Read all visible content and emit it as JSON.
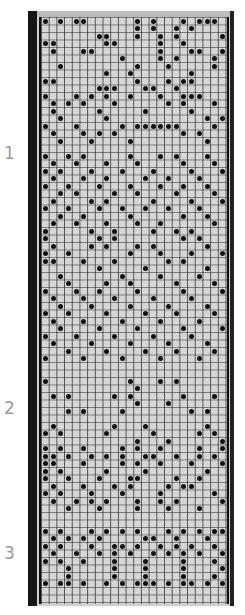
{
  "section_labels": [
    {
      "text": "1",
      "top": 143
    },
    {
      "text": "2",
      "top": 398
    },
    {
      "text": "3",
      "top": 543
    }
  ],
  "card": {
    "columns": 24,
    "rows": 78,
    "cell_w": 7.7,
    "cell_h": 7.5,
    "colors": {
      "background": "#d6d6d6",
      "band": "#161616",
      "hole": "#111111"
    }
  },
  "holes": [
    [
      1,
      1
    ],
    [
      3,
      1
    ],
    [
      5,
      1
    ],
    [
      6,
      1
    ],
    [
      13,
      1
    ],
    [
      15,
      1
    ],
    [
      19,
      1
    ],
    [
      21,
      1
    ],
    [
      22,
      1
    ],
    [
      23,
      1
    ],
    [
      13,
      2
    ],
    [
      15,
      2
    ],
    [
      18,
      2
    ],
    [
      20,
      2
    ],
    [
      8,
      3
    ],
    [
      9,
      3
    ],
    [
      13,
      3
    ],
    [
      16,
      3
    ],
    [
      18,
      3
    ],
    [
      24,
      3
    ],
    [
      1,
      4
    ],
    [
      2,
      4
    ],
    [
      9,
      4
    ],
    [
      10,
      4
    ],
    [
      16,
      4
    ],
    [
      19,
      4
    ],
    [
      2,
      5
    ],
    [
      6,
      5
    ],
    [
      7,
      5
    ],
    [
      16,
      5
    ],
    [
      20,
      5
    ],
    [
      21,
      5
    ],
    [
      24,
      5
    ],
    [
      11,
      6
    ],
    [
      16,
      6
    ],
    [
      18,
      6
    ],
    [
      23,
      6
    ],
    [
      3,
      7
    ],
    [
      13,
      7
    ],
    [
      17,
      7
    ],
    [
      23,
      7
    ],
    [
      9,
      8
    ],
    [
      12,
      8
    ],
    [
      20,
      8
    ],
    [
      1,
      9
    ],
    [
      2,
      9
    ],
    [
      13,
      9
    ],
    [
      17,
      9
    ],
    [
      19,
      9
    ],
    [
      20,
      9
    ],
    [
      8,
      10
    ],
    [
      9,
      10
    ],
    [
      10,
      10
    ],
    [
      14,
      10
    ],
    [
      15,
      10
    ],
    [
      18,
      10
    ],
    [
      1,
      11
    ],
    [
      5,
      11
    ],
    [
      7,
      11
    ],
    [
      9,
      11
    ],
    [
      12,
      11
    ],
    [
      16,
      11
    ],
    [
      19,
      11
    ],
    [
      20,
      11
    ],
    [
      21,
      11
    ],
    [
      2,
      12
    ],
    [
      4,
      12
    ],
    [
      6,
      12
    ],
    [
      10,
      12
    ],
    [
      17,
      12
    ],
    [
      19,
      12
    ],
    [
      23,
      12
    ],
    [
      2,
      13
    ],
    [
      8,
      13
    ],
    [
      14,
      13
    ],
    [
      20,
      13
    ],
    [
      3,
      14
    ],
    [
      9,
      14
    ],
    [
      22,
      14
    ],
    [
      24,
      14
    ],
    [
      1,
      15
    ],
    [
      5,
      15
    ],
    [
      11,
      15
    ],
    [
      13,
      15
    ],
    [
      14,
      15
    ],
    [
      15,
      15
    ],
    [
      16,
      15
    ],
    [
      17,
      15
    ],
    [
      18,
      15
    ],
    [
      23,
      15
    ],
    [
      2,
      16
    ],
    [
      6,
      16
    ],
    [
      8,
      16
    ],
    [
      10,
      16
    ],
    [
      19,
      16
    ],
    [
      21,
      16
    ],
    [
      3,
      17
    ],
    [
      7,
      17
    ],
    [
      12,
      17
    ],
    [
      22,
      17
    ],
    [
      1,
      19
    ],
    [
      4,
      19
    ],
    [
      6,
      19
    ],
    [
      12,
      19
    ],
    [
      16,
      19
    ],
    [
      18,
      19
    ],
    [
      22,
      19
    ],
    [
      2,
      20
    ],
    [
      5,
      20
    ],
    [
      9,
      20
    ],
    [
      13,
      20
    ],
    [
      19,
      20
    ],
    [
      23,
      20
    ],
    [
      1,
      21
    ],
    [
      3,
      21
    ],
    [
      7,
      21
    ],
    [
      11,
      21
    ],
    [
      15,
      21
    ],
    [
      20,
      21
    ],
    [
      24,
      21
    ],
    [
      2,
      22
    ],
    [
      6,
      22
    ],
    [
      9,
      22
    ],
    [
      14,
      22
    ],
    [
      17,
      22
    ],
    [
      21,
      22
    ],
    [
      1,
      23
    ],
    [
      4,
      23
    ],
    [
      8,
      23
    ],
    [
      12,
      23
    ],
    [
      16,
      23
    ],
    [
      19,
      23
    ],
    [
      22,
      23
    ],
    [
      3,
      24
    ],
    [
      5,
      24
    ],
    [
      10,
      24
    ],
    [
      13,
      24
    ],
    [
      18,
      24
    ],
    [
      23,
      24
    ],
    [
      2,
      25
    ],
    [
      7,
      25
    ],
    [
      9,
      25
    ],
    [
      15,
      25
    ],
    [
      20,
      25
    ],
    [
      24,
      25
    ],
    [
      1,
      26
    ],
    [
      4,
      26
    ],
    [
      8,
      26
    ],
    [
      11,
      26
    ],
    [
      14,
      26
    ],
    [
      17,
      26
    ],
    [
      21,
      26
    ],
    [
      3,
      27
    ],
    [
      6,
      27
    ],
    [
      12,
      27
    ],
    [
      19,
      27
    ],
    [
      22,
      27
    ],
    [
      2,
      28
    ],
    [
      5,
      28
    ],
    [
      9,
      28
    ],
    [
      13,
      28
    ],
    [
      16,
      28
    ],
    [
      23,
      28
    ],
    [
      1,
      29
    ],
    [
      7,
      29
    ],
    [
      10,
      29
    ],
    [
      15,
      29
    ],
    [
      18,
      29
    ],
    [
      20,
      29
    ],
    [
      1,
      30
    ],
    [
      8,
      30
    ],
    [
      10,
      30
    ],
    [
      19,
      30
    ],
    [
      21,
      30
    ],
    [
      2,
      31
    ],
    [
      7,
      31
    ],
    [
      9,
      31
    ],
    [
      13,
      31
    ],
    [
      15,
      31
    ],
    [
      22,
      31
    ],
    [
      1,
      32
    ],
    [
      4,
      32
    ],
    [
      12,
      32
    ],
    [
      16,
      32
    ],
    [
      20,
      32
    ],
    [
      24,
      32
    ],
    [
      1,
      33
    ],
    [
      2,
      33
    ],
    [
      6,
      33
    ],
    [
      10,
      33
    ],
    [
      17,
      33
    ],
    [
      19,
      33
    ],
    [
      8,
      34
    ],
    [
      14,
      34
    ],
    [
      22,
      34
    ],
    [
      3,
      35
    ],
    [
      11,
      35
    ],
    [
      16,
      35
    ],
    [
      21,
      35
    ],
    [
      4,
      36
    ],
    [
      9,
      36
    ],
    [
      12,
      36
    ],
    [
      18,
      36
    ],
    [
      23,
      36
    ],
    [
      1,
      37
    ],
    [
      5,
      37
    ],
    [
      8,
      37
    ],
    [
      13,
      37
    ],
    [
      19,
      37
    ],
    [
      24,
      37
    ],
    [
      2,
      38
    ],
    [
      6,
      38
    ],
    [
      10,
      38
    ],
    [
      15,
      38
    ],
    [
      20,
      38
    ],
    [
      3,
      39
    ],
    [
      7,
      39
    ],
    [
      12,
      39
    ],
    [
      17,
      39
    ],
    [
      22,
      39
    ],
    [
      1,
      40
    ],
    [
      4,
      40
    ],
    [
      9,
      40
    ],
    [
      14,
      40
    ],
    [
      18,
      40
    ],
    [
      23,
      40
    ],
    [
      2,
      41
    ],
    [
      6,
      41
    ],
    [
      11,
      41
    ],
    [
      16,
      41
    ],
    [
      21,
      41
    ],
    [
      3,
      42
    ],
    [
      8,
      42
    ],
    [
      13,
      42
    ],
    [
      19,
      42
    ],
    [
      24,
      42
    ],
    [
      1,
      43
    ],
    [
      5,
      43
    ],
    [
      10,
      43
    ],
    [
      15,
      43
    ],
    [
      20,
      43
    ],
    [
      2,
      44
    ],
    [
      7,
      44
    ],
    [
      12,
      44
    ],
    [
      17,
      44
    ],
    [
      22,
      44
    ],
    [
      4,
      45
    ],
    [
      9,
      45
    ],
    [
      14,
      45
    ],
    [
      18,
      45
    ],
    [
      23,
      45
    ],
    [
      1,
      46
    ],
    [
      6,
      46
    ],
    [
      11,
      46
    ],
    [
      16,
      46
    ],
    [
      21,
      46
    ],
    [
      1,
      49
    ],
    [
      12,
      49
    ],
    [
      16,
      49
    ],
    [
      18,
      49
    ],
    [
      13,
      50
    ],
    [
      2,
      51
    ],
    [
      4,
      51
    ],
    [
      10,
      51
    ],
    [
      12,
      51
    ],
    [
      19,
      51
    ],
    [
      23,
      51
    ],
    [
      13,
      52
    ],
    [
      17,
      52
    ],
    [
      4,
      53
    ],
    [
      6,
      53
    ],
    [
      11,
      53
    ],
    [
      20,
      53
    ],
    [
      22,
      53
    ],
    [
      2,
      55
    ],
    [
      10,
      55
    ],
    [
      14,
      55
    ],
    [
      22,
      55
    ],
    [
      1,
      56
    ],
    [
      3,
      56
    ],
    [
      9,
      56
    ],
    [
      15,
      56
    ],
    [
      21,
      56
    ],
    [
      23,
      56
    ],
    [
      13,
      57
    ],
    [
      17,
      57
    ],
    [
      24,
      57
    ],
    [
      1,
      58
    ],
    [
      3,
      58
    ],
    [
      6,
      58
    ],
    [
      11,
      58
    ],
    [
      13,
      58
    ],
    [
      16,
      58
    ],
    [
      21,
      58
    ],
    [
      24,
      58
    ],
    [
      1,
      59
    ],
    [
      2,
      59
    ],
    [
      4,
      59
    ],
    [
      7,
      59
    ],
    [
      9,
      59
    ],
    [
      11,
      59
    ],
    [
      14,
      59
    ],
    [
      15,
      59
    ],
    [
      18,
      59
    ],
    [
      21,
      59
    ],
    [
      23,
      59
    ],
    [
      1,
      60
    ],
    [
      2,
      60
    ],
    [
      6,
      60
    ],
    [
      11,
      60
    ],
    [
      13,
      60
    ],
    [
      16,
      60
    ],
    [
      20,
      60
    ],
    [
      24,
      60
    ],
    [
      1,
      61
    ],
    [
      3,
      61
    ],
    [
      9,
      61
    ],
    [
      14,
      61
    ],
    [
      22,
      61
    ],
    [
      1,
      62
    ],
    [
      4,
      62
    ],
    [
      8,
      62
    ],
    [
      12,
      62
    ],
    [
      13,
      62
    ],
    [
      18,
      62
    ],
    [
      21,
      62
    ],
    [
      2,
      63
    ],
    [
      6,
      63
    ],
    [
      10,
      63
    ],
    [
      12,
      63
    ],
    [
      17,
      63
    ],
    [
      19,
      63
    ],
    [
      20,
      63
    ],
    [
      1,
      64
    ],
    [
      3,
      64
    ],
    [
      7,
      64
    ],
    [
      11,
      64
    ],
    [
      16,
      64
    ],
    [
      23,
      64
    ],
    [
      2,
      65
    ],
    [
      5,
      65
    ],
    [
      7,
      65
    ],
    [
      9,
      65
    ],
    [
      13,
      65
    ],
    [
      16,
      65
    ],
    [
      18,
      65
    ],
    [
      24,
      65
    ],
    [
      4,
      66
    ],
    [
      8,
      66
    ],
    [
      13,
      66
    ],
    [
      17,
      66
    ],
    [
      21,
      66
    ],
    [
      1,
      69
    ],
    [
      3,
      69
    ],
    [
      7,
      69
    ],
    [
      9,
      69
    ],
    [
      11,
      69
    ],
    [
      13,
      69
    ],
    [
      17,
      69
    ],
    [
      19,
      69
    ],
    [
      21,
      69
    ],
    [
      23,
      69
    ],
    [
      24,
      69
    ],
    [
      2,
      70
    ],
    [
      4,
      70
    ],
    [
      6,
      70
    ],
    [
      8,
      70
    ],
    [
      14,
      70
    ],
    [
      15,
      70
    ],
    [
      18,
      70
    ],
    [
      22,
      70
    ],
    [
      1,
      71
    ],
    [
      3,
      71
    ],
    [
      7,
      71
    ],
    [
      10,
      71
    ],
    [
      11,
      71
    ],
    [
      13,
      71
    ],
    [
      16,
      71
    ],
    [
      18,
      71
    ],
    [
      20,
      71
    ],
    [
      23,
      71
    ],
    [
      2,
      72
    ],
    [
      5,
      72
    ],
    [
      8,
      72
    ],
    [
      10,
      72
    ],
    [
      12,
      72
    ],
    [
      15,
      72
    ],
    [
      17,
      72
    ],
    [
      19,
      72
    ],
    [
      21,
      72
    ],
    [
      24,
      72
    ],
    [
      1,
      73
    ],
    [
      3,
      73
    ],
    [
      6,
      73
    ],
    [
      10,
      73
    ],
    [
      14,
      73
    ],
    [
      19,
      73
    ],
    [
      23,
      73
    ],
    [
      4,
      74
    ],
    [
      10,
      74
    ],
    [
      14,
      74
    ],
    [
      19,
      74
    ],
    [
      24,
      74
    ],
    [
      4,
      75
    ],
    [
      10,
      75
    ],
    [
      14,
      75
    ],
    [
      19,
      75
    ],
    [
      23,
      75
    ],
    [
      1,
      76
    ],
    [
      3,
      76
    ],
    [
      4,
      76
    ],
    [
      6,
      76
    ],
    [
      9,
      76
    ],
    [
      11,
      76
    ],
    [
      13,
      76
    ],
    [
      14,
      76
    ],
    [
      15,
      76
    ],
    [
      17,
      76
    ],
    [
      19,
      76
    ],
    [
      20,
      76
    ],
    [
      22,
      76
    ],
    [
      24,
      76
    ]
  ]
}
